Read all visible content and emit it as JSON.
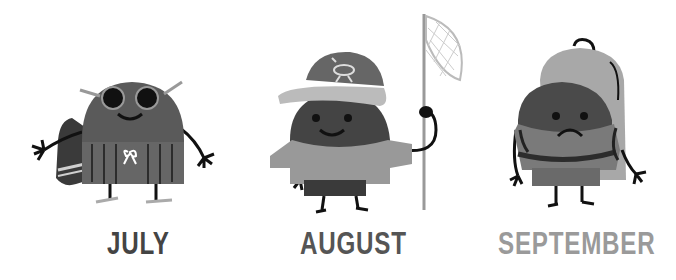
{
  "panels": [
    {
      "month": "JULY",
      "color": "#444444",
      "scene": "sunglasses-swim-trunks-towel"
    },
    {
      "month": "AUGUST",
      "color": "#555555",
      "scene": "cap-butterfly-net"
    },
    {
      "month": "SEPTEMBER",
      "color": "#9a9a9a",
      "scene": "backpack-sad"
    }
  ]
}
